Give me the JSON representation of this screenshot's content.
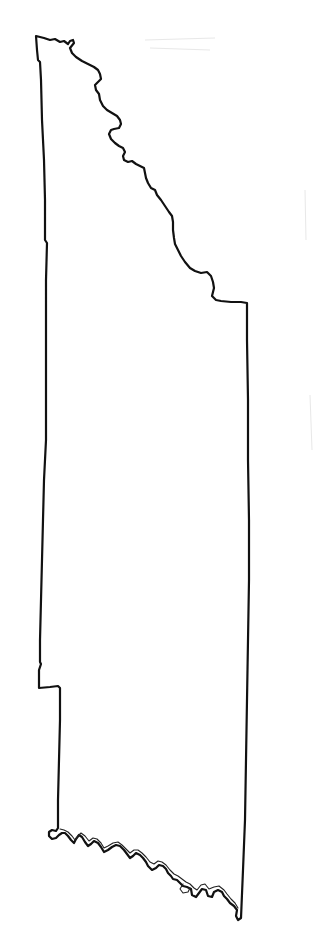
{
  "map": {
    "type": "county-outline",
    "title": "",
    "background_color": "#ffffff",
    "outline_color": "#111111",
    "features": [
      {
        "name": "northeast-river-boundary",
        "kind": "meandering river border"
      },
      {
        "name": "south-river-boundary",
        "kind": "meandering river border with double channel"
      },
      {
        "name": "west-boundary",
        "kind": "straight survey line with small jogs"
      },
      {
        "name": "east-boundary",
        "kind": "straight survey line"
      }
    ]
  }
}
